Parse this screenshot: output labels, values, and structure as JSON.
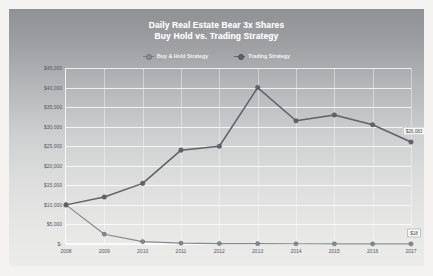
{
  "chart_data": {
    "type": "line",
    "title": "Daily Real Estate Bear 3x Shares",
    "subtitle": "Buy Hold vs. Trading Strategy",
    "title_lines": [
      "Daily Real Estate Bear 3x Shares",
      "Buy Hold vs. Trading Strategy"
    ],
    "xlabel": "",
    "ylabel": "",
    "categories": [
      "2008",
      "2009",
      "2010",
      "2011",
      "2012",
      "2013",
      "2014",
      "2015",
      "2016",
      "2017"
    ],
    "ylim": [
      0,
      45000
    ],
    "ytick_labels": [
      "$45,000",
      "$40,000",
      "$35,000",
      "$30,000",
      "$25,000",
      "$20,000",
      "$15,000",
      "$10,000",
      "$5,000",
      "$-"
    ],
    "ytick_values": [
      45000,
      40000,
      35000,
      30000,
      25000,
      20000,
      15000,
      10000,
      5000,
      0
    ],
    "grid": true,
    "legend_position": "top",
    "series": [
      {
        "name": "Buy & Hold Strategy",
        "color": "#86898d",
        "values": [
          10000,
          2500,
          600,
          200,
          120,
          80,
          60,
          45,
          30,
          18
        ],
        "end_label": "$18"
      },
      {
        "name": "Trading Strategy",
        "color": "#5f6267",
        "values": [
          10000,
          12000,
          15500,
          24000,
          25000,
          40000,
          31500,
          33000,
          30500,
          26083
        ],
        "end_label": "$26,083"
      }
    ],
    "annotations": [
      {
        "text": "$26,083",
        "series": "Trading Strategy",
        "category": "2017"
      },
      {
        "text": "$18",
        "series": "Buy & Hold Strategy",
        "category": "2017"
      }
    ]
  },
  "legend": {
    "items": [
      {
        "label": "Buy & Hold Strategy"
      },
      {
        "label": "Trading Strategy"
      }
    ]
  }
}
